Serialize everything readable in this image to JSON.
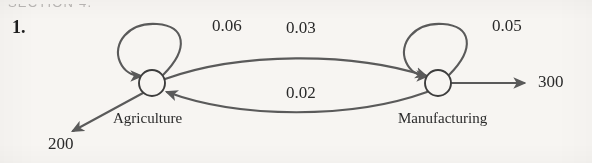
{
  "page": {
    "header_cut_text": "SECTION 4.",
    "exercise_number": "1.",
    "background_color": "#f7f5f2",
    "ink_color": "#5a5a5a",
    "text_color": "#2a2a2a"
  },
  "diagram": {
    "type": "directed-graph",
    "nodes": [
      {
        "id": "agriculture",
        "label": "Agriculture",
        "cx": 152,
        "cy": 83,
        "r": 13
      },
      {
        "id": "manufacturing",
        "label": "Manufacturing",
        "cx": 438,
        "cy": 83,
        "r": 13
      }
    ],
    "self_loops": [
      {
        "node": "agriculture",
        "label": "0.06",
        "label_x": 212,
        "label_y": 16
      },
      {
        "node": "manufacturing",
        "label": "0.05",
        "label_x": 492,
        "label_y": 16
      }
    ],
    "edges": [
      {
        "from": "agriculture",
        "to": "manufacturing",
        "label": "0.03",
        "label_x": 286,
        "label_y": 18,
        "curve": "upper"
      },
      {
        "from": "manufacturing",
        "to": "agriculture",
        "label": "0.02",
        "label_x": 286,
        "label_y": 83,
        "curve": "lower"
      }
    ],
    "external_flows": [
      {
        "id": "agriculture-output",
        "from": "agriculture",
        "label": "200",
        "direction": "down-left",
        "label_x": 48,
        "label_y": 134
      },
      {
        "id": "manufacturing-output",
        "from": "manufacturing",
        "label": "300",
        "direction": "right",
        "label_x": 538,
        "label_y": 74
      }
    ]
  }
}
